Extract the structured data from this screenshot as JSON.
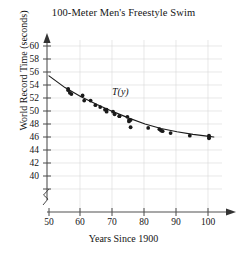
{
  "chart_data": {
    "type": "scatter",
    "title": "100-Meter Men's Freestyle Swim",
    "xlabel": "Years Since 1900",
    "ylabel": "World Record Time (seconds)",
    "xlim": [
      50,
      103
    ],
    "ylim": [
      39,
      61
    ],
    "grid": true,
    "legend": null,
    "axis_break_x": true,
    "axis_break_y": true,
    "xticks": [
      50,
      60,
      70,
      80,
      90,
      100
    ],
    "yticks": [
      40,
      42,
      44,
      46,
      48,
      50,
      52,
      54,
      56,
      58,
      60
    ],
    "xtick_labels": [
      "50",
      "60",
      "70",
      "80",
      "90",
      "100"
    ],
    "ytick_labels": [
      "40",
      "42",
      "44",
      "46",
      "48",
      "50",
      "52",
      "54",
      "56",
      "58",
      "60"
    ],
    "series": [
      {
        "name": "World record times",
        "type": "scatter",
        "marker": "filled-circle",
        "color": "#1a1a1a",
        "points": [
          {
            "x": 56,
            "y": 55.4
          },
          {
            "x": 56,
            "y": 55.2
          },
          {
            "x": 56.5,
            "y": 54.8
          },
          {
            "x": 57,
            "y": 54.6
          },
          {
            "x": 60.5,
            "y": 54.4
          },
          {
            "x": 61,
            "y": 53.6
          },
          {
            "x": 63,
            "y": 53.6
          },
          {
            "x": 64.5,
            "y": 52.9
          },
          {
            "x": 66,
            "y": 52.6
          },
          {
            "x": 67.5,
            "y": 52.2
          },
          {
            "x": 68,
            "y": 52.2
          },
          {
            "x": 68,
            "y": 51.9
          },
          {
            "x": 70,
            "y": 51.9
          },
          {
            "x": 70.5,
            "y": 51.5
          },
          {
            "x": 72,
            "y": 51.2
          },
          {
            "x": 72,
            "y": 51.2
          },
          {
            "x": 74.5,
            "y": 51.1
          },
          {
            "x": 75,
            "y": 50.6
          },
          {
            "x": 75,
            "y": 50.4
          },
          {
            "x": 75.5,
            "y": 50.6
          },
          {
            "x": 75.5,
            "y": 49.5
          },
          {
            "x": 81,
            "y": 49.4
          },
          {
            "x": 84.5,
            "y": 49.2
          },
          {
            "x": 85,
            "y": 49.0
          },
          {
            "x": 85.5,
            "y": 48.9
          },
          {
            "x": 88,
            "y": 48.6
          },
          {
            "x": 94,
            "y": 48.2
          },
          {
            "x": 100,
            "y": 48.2
          },
          {
            "x": 100,
            "y": 48.0
          },
          {
            "x": 100,
            "y": 47.8
          }
        ]
      },
      {
        "name": "T(y)",
        "type": "line",
        "color": "#1a1a1a",
        "annotation": "T(y)",
        "points": [
          {
            "x": 50,
            "y": 57.4
          },
          {
            "x": 55,
            "y": 55.6
          },
          {
            "x": 60,
            "y": 54.2
          },
          {
            "x": 65,
            "y": 53.0
          },
          {
            "x": 70,
            "y": 51.9
          },
          {
            "x": 75,
            "y": 50.9
          },
          {
            "x": 80,
            "y": 50.0
          },
          {
            "x": 85,
            "y": 49.3
          },
          {
            "x": 90,
            "y": 48.8
          },
          {
            "x": 95,
            "y": 48.4
          },
          {
            "x": 100,
            "y": 48.1
          },
          {
            "x": 101.5,
            "y": 48.0
          }
        ]
      }
    ],
    "annotations": [
      {
        "text": "T(y)",
        "x": 74,
        "y": 52.6
      }
    ]
  }
}
